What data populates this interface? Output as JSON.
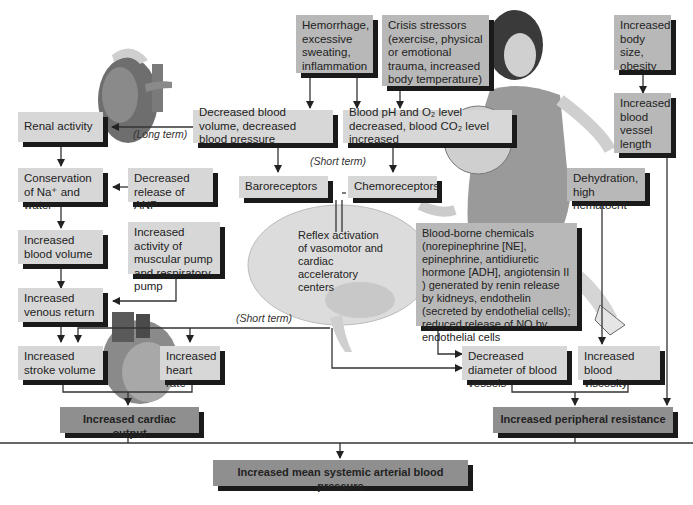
{
  "labels": {
    "long_term": "(Long term)",
    "short_term_1": "(Short term)",
    "short_term_2": "(Short term)"
  },
  "boxes": {
    "hemorrhage": "Hemorrhage, excessive sweating, inflammation",
    "crisis": "Crisis stressors (exercise, physical or emotional trauma, increased body temperature)",
    "body_size": "Increased body size, obesity",
    "vessel_length": "Increased blood vessel length",
    "dec_volume": "Decreased blood volume, decreased blood pressure",
    "blood_ph": "Blood pH and O₂ level decreased, blood CO₂ level increased",
    "renal": "Renal activity",
    "conservation": "Conservation of Na⁺ and water",
    "anp": "Decreased release of ANP",
    "inc_blood_volume": "Increased blood volume",
    "muscular_pump": "Increased activity of muscular pump and respiratory pump",
    "venous_return": "Increased venous return",
    "baroreceptors": "Baroreceptors",
    "chemoreceptors": "Chemoreceptors",
    "reflex": "Reflex activation of vasomotor and cardiac acceleratory centers",
    "dehydration": "Dehydration, high hematocrit",
    "chemicals": "Blood-borne chemicals (norepinephrine [NE], epinephrine, antidiuretic hormone [ADH], angiotensin II ) generated by renin release by kidneys, endothelin (secreted by endothelial cells); reduced release of NO by endothelial cells",
    "stroke_volume": "Increased stroke volume",
    "heart_rate": "Increased heart rate",
    "dec_diameter": "Decreased diameter of blood vessels",
    "viscosity": "Increased blood viscosity",
    "cardiac_output": "Increased cardiac output",
    "peripheral_resistance": "Increased peripheral resistance",
    "map": "Increased mean systemic arterial blood pressure"
  },
  "illustrations": [
    "kidney",
    "brain",
    "heart",
    "athlete-with-ball"
  ]
}
